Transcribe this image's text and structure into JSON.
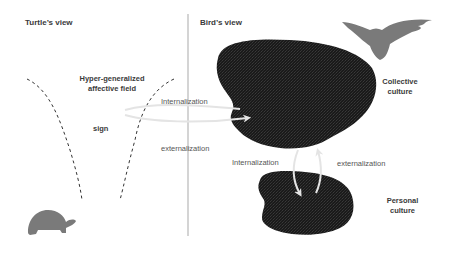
{
  "panels": {
    "left": {
      "title": "Turtle’s view"
    },
    "right": {
      "title": "Bird’s view"
    }
  },
  "labels": {
    "field_line1": "Hyper-generalized",
    "field_line2": "affective field",
    "sign": "sign",
    "internalization_top": "Internalization",
    "externalization_top": "externalization",
    "internalization_bottom": "Internalization",
    "externalization_bottom": "externalization",
    "collective_line1": "Collective",
    "collective_line2": "culture",
    "personal_line1": "Personal",
    "personal_line2": "culture"
  },
  "icons": {
    "turtle": "turtle-silhouette",
    "bird": "bird-silhouette"
  },
  "colors": {
    "blob": "#1c1c1c",
    "silhouette": "#7a7a7a",
    "arrow": "#e4e4e4",
    "divider": "#b8b8b8",
    "dashed": "#333333",
    "text": "#3a3a3a"
  }
}
